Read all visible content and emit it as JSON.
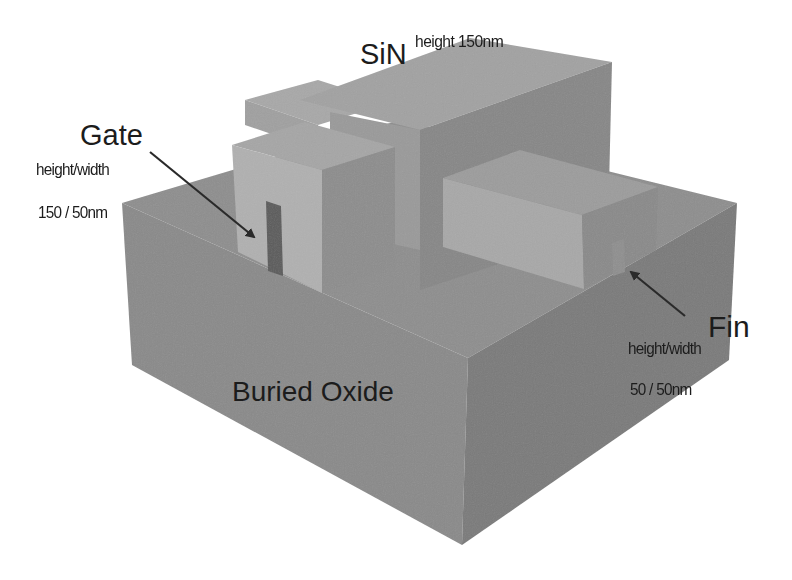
{
  "diagram": {
    "type": "3d-isometric-device-structure",
    "colors": {
      "background": "#ffffff",
      "oxide_top": "#8e8e8e",
      "oxide_front_left": "#8a8a8a",
      "oxide_front_right": "#7a7a7a",
      "sin_top": "#a2a2a2",
      "sin_front": "#9a9a9a",
      "sin_side": "#878787",
      "gate_block_front": "#b0b0b0",
      "gate_block_top": "#a6a6a6",
      "gate_block_side": "#8d8d8d",
      "pad_top": "#9c9c9c",
      "pad_front": "#a8a8a8",
      "pad_side": "#8a8a8a",
      "gate_contact": "#5c5c5c",
      "fin": "#8f8f8f",
      "text": "#1c1c1c",
      "arrow": "#2a2a2a"
    }
  },
  "labels": {
    "sin": {
      "title": "SiN",
      "superscript": "height 150nm"
    },
    "gate": {
      "title": "Gate",
      "line1": "height/width",
      "line2": "150 / 50nm"
    },
    "fin": {
      "title": "Fin",
      "line1": "height/width",
      "line2": "50 / 50nm"
    },
    "oxide": {
      "title": "Buried Oxide"
    }
  }
}
